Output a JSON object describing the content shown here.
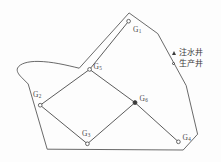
{
  "figure": {
    "title": ""
  },
  "colors": {
    "boundary_stroke": "#4f4f4f",
    "connector_stroke": "#3f3f3f",
    "marker_stroke": "#3b3b3b",
    "marker_fill": "#ffffff",
    "injector_fill": "#3b3b3b",
    "label_color": "#4a4a4a",
    "background": "#fdfdfd"
  },
  "legend": {
    "items": [
      {
        "marker": "triangle-filled-icon",
        "label_prefix": "注水井",
        "label_full": "注水井"
      },
      {
        "marker": "circle-hollow-icon",
        "label_prefix": "生产井",
        "label_full": "生产井"
      }
    ]
  },
  "wells": [
    {
      "id": "G1",
      "label": "G",
      "subscript": "1",
      "x": 129.0,
      "y": 21.0,
      "type": "producer",
      "label_x": 133.0,
      "label_y": 25.5
    },
    {
      "id": "G5",
      "label": "G",
      "subscript": "5",
      "x": 89.5,
      "y": 69.5,
      "type": "producer",
      "label_x": 93.5,
      "label_y": 62.5
    },
    {
      "id": "G2",
      "label": "G",
      "subscript": "2",
      "x": 40.0,
      "y": 105.0,
      "type": "producer",
      "label_x": 33.0,
      "label_y": 91.0
    },
    {
      "id": "G6",
      "label": "G",
      "subscript": "6",
      "x": 135.0,
      "y": 102.5,
      "type": "injector",
      "label_x": 139.5,
      "label_y": 95.0
    },
    {
      "id": "G3",
      "label": "G",
      "subscript": "3",
      "x": 87.5,
      "y": 144.0,
      "type": "producer",
      "label_x": 82.0,
      "label_y": 130.0
    },
    {
      "id": "G4",
      "label": "G",
      "subscript": "4",
      "x": 178.5,
      "y": 142.0,
      "type": "producer",
      "label_x": 182.5,
      "label_y": 134.0
    }
  ],
  "connectors": [
    {
      "from": "G1",
      "to": "G5"
    },
    {
      "from": "G5",
      "to": "G2"
    },
    {
      "from": "G2",
      "to": "G3"
    },
    {
      "from": "G3",
      "to": "G6"
    },
    {
      "from": "G6",
      "to": "G5"
    },
    {
      "from": "G6",
      "to": "G4"
    }
  ],
  "boundary": {
    "points": "128.5,13.5 78.5,68.5 48.5,64.5 30.5,62.0 19.5,66.0 17.5,70.5 20.0,75.0 27.5,83.5 47.5,149.0 183.5,150.0 197.5,134.5 186.5,86.0",
    "curve_note": "upper-left edge is a soft concave curve"
  }
}
